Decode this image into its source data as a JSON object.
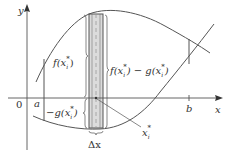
{
  "figure": {
    "type": "area-between-curves",
    "colors": {
      "ink": "#555555",
      "text": "#333333",
      "strip_fill": "#dcdcdc",
      "strip_edge": "#555555",
      "dashed": "#999999"
    }
  },
  "axes": {
    "x_label": "x",
    "y_label": "y",
    "origin_label": "0"
  },
  "ticks": {
    "a_label": "a",
    "b_label": "b"
  },
  "labels": {
    "f_at_xi": "f(x",
    "f_sub": "i",
    "f_sup": "*",
    "f_close": ")",
    "fg_diff_f": "f(x",
    "fg_diff_mid": ") − g(x",
    "fg_close": ")",
    "neg_g": "−g(x",
    "neg_g_close": ")",
    "xi_star": "x",
    "xi_sub": "i",
    "xi_sup": "*",
    "delta_x": "Δx"
  }
}
